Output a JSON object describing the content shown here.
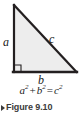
{
  "figure": {
    "background_color": "#ffffff",
    "diagram": {
      "shape_name": "right-triangle",
      "fill_color": "#ededed",
      "stroke_color": "#231f20",
      "vertices": {
        "apex": [
          14,
          5
        ],
        "right_angle": [
          14,
          72
        ],
        "base_right": [
          76,
          72
        ]
      },
      "right_angle_marker": true,
      "labels": {
        "leg_vertical": "a",
        "hypotenuse": "c",
        "leg_horizontal": "b"
      }
    },
    "equation": {
      "left_term_base": "a",
      "left_term_exp": "2",
      "plus": "+",
      "second_term_base": "b",
      "second_term_exp": "2",
      "equals": "=",
      "right_term_base": "c",
      "right_term_exp": "2",
      "plain_text": "a² + b² = c²"
    },
    "caption": {
      "marker_icon": "triangle-right-icon",
      "text": "Figure 9.10",
      "color": "#3b3b3b"
    }
  }
}
